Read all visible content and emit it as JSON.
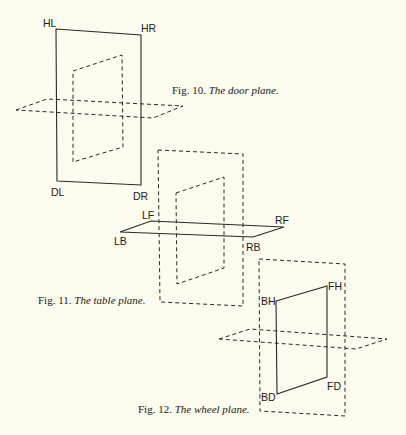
{
  "figures": [
    {
      "id": "fig10",
      "caption_number": "Fig. 10.",
      "caption_title": "The door plane.",
      "labels": {
        "top_left": "HL",
        "top_right": "HR",
        "bottom_left": "DL",
        "bottom_right": "DR"
      }
    },
    {
      "id": "fig11",
      "caption_number": "Fig. 11.",
      "caption_title": "The table plane.",
      "labels": {
        "left_front": "LF",
        "right_front": "RF",
        "left_back": "LB",
        "right_back": "RB"
      }
    },
    {
      "id": "fig12",
      "caption_number": "Fig. 12.",
      "caption_title": "The wheel plane.",
      "labels": {
        "back_high": "BH",
        "front_high": "FH",
        "back_down": "BD",
        "front_down": "FD"
      }
    }
  ],
  "colors": {
    "ink": "#2a2a28",
    "paper": "#fcfbee"
  }
}
